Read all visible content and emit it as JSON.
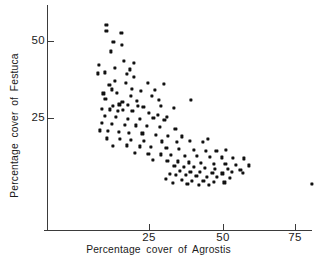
{
  "chart_data": {
    "type": "scatter",
    "title": "",
    "xlabel": "Percentage  cover  of  Agrostis",
    "ylabel": "Percentage  cover  of  Festuca",
    "xlim": [
      0,
      78
    ],
    "ylim": [
      0,
      62
    ],
    "xticks": [
      25,
      50,
      75
    ],
    "yticks": [
      25,
      50
    ],
    "xtick_labels": [
      "25",
      "50",
      "75"
    ],
    "ytick_labels": [
      "25",
      "50"
    ],
    "grid": false,
    "legend": null,
    "marker": "square-dot",
    "marker_color": "#111111",
    "axis_color": "#3b3b3b",
    "n_points": 140,
    "points": [
      [
        10.6,
        55.1
      ],
      [
        10.6,
        53.2
      ],
      [
        15.7,
        52.5
      ],
      [
        15.9,
        48.6
      ],
      [
        13.0,
        49.8
      ],
      [
        12.2,
        46.6
      ],
      [
        8.2,
        42.3
      ],
      [
        7.6,
        39.5
      ],
      [
        16.4,
        43.5
      ],
      [
        19.9,
        42.8
      ],
      [
        13.4,
        41.2
      ],
      [
        18.5,
        40.8
      ],
      [
        17.5,
        39.2
      ],
      [
        10.0,
        39.8
      ],
      [
        20.0,
        38.3
      ],
      [
        13.4,
        37.1
      ],
      [
        11.6,
        35.8
      ],
      [
        17.2,
        36.5
      ],
      [
        24.5,
        36.4
      ],
      [
        30.0,
        36.2
      ],
      [
        12.5,
        34.3
      ],
      [
        19.3,
        34.5
      ],
      [
        22.4,
        33.8
      ],
      [
        27.1,
        34.0
      ],
      [
        9.6,
        33.0
      ],
      [
        14.1,
        33.2
      ],
      [
        18.9,
        32.3
      ],
      [
        26.0,
        32.1
      ],
      [
        39.2,
        30.9
      ],
      [
        10.3,
        31.3
      ],
      [
        16.0,
        30.2
      ],
      [
        20.8,
        30.5
      ],
      [
        28.3,
        30.8
      ],
      [
        12.8,
        29.0
      ],
      [
        15.0,
        29.4
      ],
      [
        17.8,
        29.2
      ],
      [
        21.3,
        28.9
      ],
      [
        23.1,
        28.7
      ],
      [
        29.0,
        28.8
      ],
      [
        33.3,
        28.2
      ],
      [
        9.2,
        27.9
      ],
      [
        11.8,
        27.8
      ],
      [
        14.6,
        27.4
      ],
      [
        16.2,
        27.6
      ],
      [
        19.4,
        27.2
      ],
      [
        25.1,
        26.6
      ],
      [
        28.0,
        26.0
      ],
      [
        31.0,
        25.3
      ],
      [
        10.1,
        25.8
      ],
      [
        13.7,
        25.4
      ],
      [
        18.0,
        24.8
      ],
      [
        22.0,
        24.6
      ],
      [
        26.5,
        24.9
      ],
      [
        30.2,
        24.4
      ],
      [
        9.0,
        23.5
      ],
      [
        12.4,
        23.2
      ],
      [
        16.8,
        22.8
      ],
      [
        20.5,
        22.6
      ],
      [
        24.2,
        22.4
      ],
      [
        28.6,
        22.0
      ],
      [
        33.9,
        21.5
      ],
      [
        8.5,
        21.0
      ],
      [
        11.1,
        20.7
      ],
      [
        14.8,
        20.4
      ],
      [
        18.2,
        20.2
      ],
      [
        22.8,
        20.0
      ],
      [
        27.2,
        19.6
      ],
      [
        31.5,
        19.2
      ],
      [
        36.1,
        19.0
      ],
      [
        10.8,
        18.4
      ],
      [
        15.3,
        18.2
      ],
      [
        19.0,
        18.0
      ],
      [
        23.4,
        17.5
      ],
      [
        29.3,
        17.4
      ],
      [
        34.5,
        17.2
      ],
      [
        38.8,
        17.6
      ],
      [
        43.1,
        17.3
      ],
      [
        45.0,
        18.3
      ],
      [
        12.9,
        16.0
      ],
      [
        17.6,
        16.1
      ],
      [
        21.9,
        15.8
      ],
      [
        25.6,
        15.5
      ],
      [
        30.9,
        15.2
      ],
      [
        35.2,
        15.0
      ],
      [
        40.3,
        14.7
      ],
      [
        44.2,
        14.4
      ],
      [
        47.8,
        14.2
      ],
      [
        51.0,
        14.6
      ],
      [
        20.3,
        13.8
      ],
      [
        24.8,
        13.4
      ],
      [
        28.9,
        13.2
      ],
      [
        32.5,
        13.0
      ],
      [
        37.0,
        12.8
      ],
      [
        41.2,
        12.6
      ],
      [
        45.6,
        12.4
      ],
      [
        49.5,
        12.2
      ],
      [
        53.4,
        12.0
      ],
      [
        57.1,
        11.9
      ],
      [
        26.3,
        11.4
      ],
      [
        31.2,
        11.1
      ],
      [
        34.8,
        10.9
      ],
      [
        38.4,
        10.6
      ],
      [
        42.6,
        10.4
      ],
      [
        46.9,
        10.2
      ],
      [
        50.8,
        10.0
      ],
      [
        54.3,
        9.8
      ],
      [
        33.6,
        9.4
      ],
      [
        36.9,
        9.2
      ],
      [
        40.1,
        9.0
      ],
      [
        43.8,
        8.8
      ],
      [
        47.2,
        8.6
      ],
      [
        51.6,
        8.4
      ],
      [
        55.9,
        8.2
      ],
      [
        58.7,
        9.6
      ],
      [
        35.4,
        7.8
      ],
      [
        39.0,
        7.6
      ],
      [
        42.2,
        7.4
      ],
      [
        46.4,
        7.2
      ],
      [
        49.8,
        7.0
      ],
      [
        53.1,
        7.6
      ],
      [
        56.8,
        7.2
      ],
      [
        32.0,
        6.8
      ],
      [
        34.2,
        6.6
      ],
      [
        37.5,
        6.4
      ],
      [
        41.0,
        6.2
      ],
      [
        44.5,
        6.0
      ],
      [
        48.0,
        5.8
      ],
      [
        52.2,
        5.5
      ],
      [
        30.8,
        5.2
      ],
      [
        36.2,
        4.9
      ],
      [
        39.6,
        4.7
      ],
      [
        43.4,
        4.5
      ],
      [
        47.0,
        4.3
      ],
      [
        50.5,
        4.1
      ],
      [
        33.1,
        3.8
      ],
      [
        38.0,
        3.6
      ],
      [
        41.8,
        3.4
      ],
      [
        45.3,
        3.2
      ],
      [
        80.0,
        3.6
      ]
    ]
  },
  "axis": {
    "x_title": "Percentage  cover  of  Agrostis",
    "y_title": "Percentage  cover  of  Festuca",
    "x_tick_25": "25",
    "x_tick_50": "50",
    "x_tick_75": "75",
    "y_tick_25": "25",
    "y_tick_50": "50"
  }
}
